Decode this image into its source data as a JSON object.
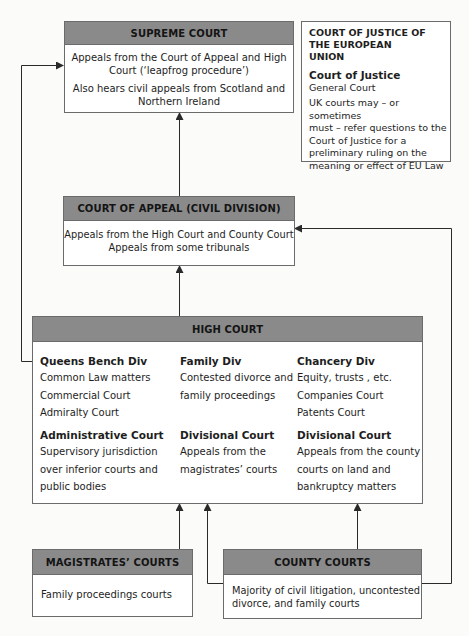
{
  "supreme_court": {
    "title": "SUPREME COURT",
    "lines": [
      "Appeals from the Court of Appeal and High",
      "Court (‘leapfrog procedure’)",
      "Also hears civil appeals from Scotland and",
      "Northern Ireland"
    ]
  },
  "cjeu": {
    "title_lines": [
      "COURT OF JUSTICE OF",
      "THE EUROPEAN",
      "UNION"
    ],
    "subtitle": "Court of Justice",
    "general_court": "General Court",
    "description_lines": [
      "UK courts may – or sometimes",
      "must – refer questions to the",
      "Court of Justice for a",
      "preliminary ruling on the",
      "meaning or effect of EU Law"
    ]
  },
  "court_of_appeal": {
    "title": "COURT OF APPEAL (CIVIL DIVISION)",
    "lines": [
      "Appeals from the High Court and County Court",
      "Appeals from some tribunals"
    ]
  },
  "high_court": {
    "title": "HIGH COURT",
    "divisions": [
      {
        "title": "Queens Bench Div",
        "lines": [
          "Common Law matters",
          "Commercial Court",
          "Admiralty Court"
        ]
      },
      {
        "title": "Family Div",
        "lines": [
          "Contested divorce and",
          "family proceedings"
        ]
      },
      {
        "title": "Chancery Div",
        "lines": [
          "Equity, trusts , etc.",
          "Companies Court",
          "Patents Court"
        ]
      },
      {
        "title": "Administrative Court",
        "lines": [
          "Supervisory jurisdiction",
          "over inferior courts and",
          "public bodies"
        ]
      },
      {
        "title": "Divisional Court",
        "lines": [
          "Appeals from the",
          "magistrates’ courts"
        ]
      },
      {
        "title": "Divisional Court",
        "lines": [
          "Appeals from the county",
          "courts on land and",
          "bankruptcy matters"
        ]
      }
    ]
  },
  "magistrates_courts": {
    "title": "MAGISTRATES’ COURTS",
    "lines": [
      "Family proceedings courts"
    ]
  },
  "county_courts": {
    "title": "COUNTY COURTS",
    "lines": [
      "Majority of civil litigation, uncontested",
      "divorce, and family courts"
    ]
  },
  "colors": {
    "header_fill": "#8a8a8a",
    "border": "#6b6b6b",
    "line": "#2a2a2a"
  }
}
